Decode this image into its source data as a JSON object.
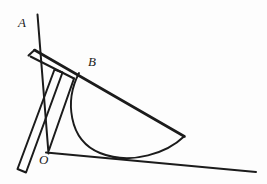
{
  "figure": {
    "background_color": "#fdfdfd",
    "stroke_color": "#1b1b1b",
    "labels": [
      {
        "id": "A",
        "text": "A",
        "x": 18,
        "y": 27,
        "role": "ray-endpoint-label"
      },
      {
        "id": "B",
        "text": "B",
        "x": 88,
        "y": 66,
        "role": "point-label"
      },
      {
        "id": "O",
        "text": "O",
        "x": 39,
        "y": 164,
        "role": "vertex-label"
      }
    ],
    "points": {
      "A_tip": {
        "x": 37,
        "y": 15
      },
      "O": {
        "x": 48,
        "y": 152
      },
      "B": {
        "x": 80,
        "y": 73
      },
      "corner": {
        "x": 184,
        "y": 136
      },
      "base_end": {
        "x": 256,
        "y": 172
      }
    },
    "ray_OA": {
      "from": "O",
      "to": "A_tip",
      "label": "A"
    },
    "baseline": {
      "from": "O",
      "to": "base_end"
    },
    "upper_edge": {
      "from_near": "top-left-strip",
      "to": "corner"
    },
    "arc": {
      "type": "semicircle-arc",
      "from": "B",
      "to": "corner",
      "description": "protractor curved edge bowing below the baseline"
    },
    "ruler_strip": {
      "description": "thin straightedge quadrilateral crossing ray OA, extending below-left past O"
    }
  }
}
